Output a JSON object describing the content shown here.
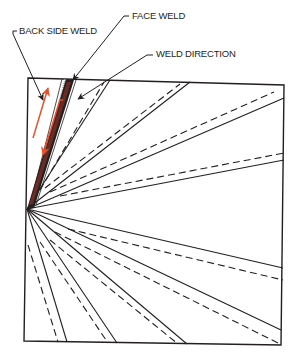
{
  "labels": {
    "face_weld": "FACE WELD",
    "back_side_weld": "BACK SIDE WELD",
    "weld_direction": "WELD DIRECTION"
  },
  "colors": {
    "line": "#231f20",
    "weld_direction_arrow": "#e8502a",
    "face_weld_bead": "#6b2a22",
    "back_weld_bead": "#9aa0a6"
  },
  "diagram": {
    "apex": [
      27,
      209
    ],
    "square_corners": [
      [
        28,
        78
      ],
      [
        284,
        85
      ],
      [
        281,
        345
      ],
      [
        24,
        341
      ]
    ],
    "radial_lines_upper": [
      {
        "type": "solid",
        "end": [
          110,
          80
        ]
      },
      {
        "type": "dashed",
        "end": [
          104,
          82
        ]
      },
      {
        "type": "solid",
        "end": [
          190,
          82
        ]
      },
      {
        "type": "dashed",
        "end": [
          180,
          84
        ]
      },
      {
        "type": "solid",
        "end": [
          284,
          98
        ]
      },
      {
        "type": "dashed",
        "end": [
          274,
          92
        ]
      },
      {
        "type": "solid",
        "end": [
          284,
          160
        ]
      },
      {
        "type": "dashed",
        "end": [
          284,
          153
        ]
      }
    ],
    "radial_lines_lower": [
      {
        "type": "solid",
        "end": [
          283,
          268
        ]
      },
      {
        "type": "dashed",
        "end": [
          283,
          280
        ]
      },
      {
        "type": "solid",
        "end": [
          281,
          330
        ]
      },
      {
        "type": "dashed",
        "end": [
          278,
          343
        ]
      },
      {
        "type": "solid",
        "end": [
          187,
          344
        ]
      },
      {
        "type": "dashed",
        "end": [
          178,
          344
        ]
      },
      {
        "type": "solid",
        "end": [
          117,
          343
        ]
      },
      {
        "type": "dashed",
        "end": [
          108,
          343
        ]
      },
      {
        "type": "solid",
        "end": [
          67,
          342
        ]
      },
      {
        "type": "dashed",
        "end": [
          58,
          342
        ]
      }
    ]
  }
}
